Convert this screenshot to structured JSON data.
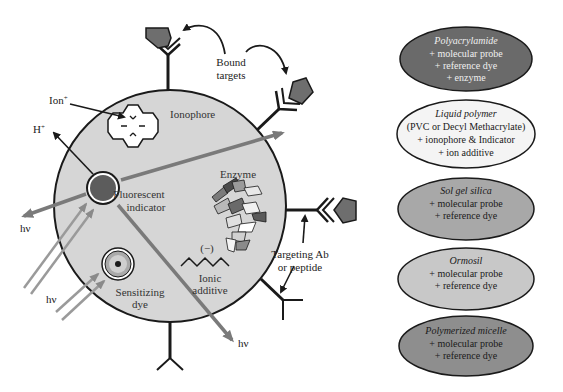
{
  "colors": {
    "background": "#ffffff",
    "particle_fill": "#d6d6d6",
    "outline": "#1a1a1a",
    "light_ray": "#7a7a7a",
    "target_fill": "#6e6e6e",
    "indicator_fill": "#5c5c5c",
    "dark_ellipse": "#6a6a6a",
    "mid_ellipse": "#a8a8a8",
    "light_ellipse": "#c8c8c8",
    "white_ellipse": "#f2f2f2"
  },
  "particle": {
    "labels": {
      "ionophore": "Ionophore",
      "fluorescent_indicator_line1": "Fluorescent",
      "fluorescent_indicator_line2": "indicator",
      "enzyme": "Enzyme",
      "ionic_charge": "(−)",
      "ionic_additive_line1": "Ionic",
      "ionic_additive_line2": "additive",
      "sensitizing_dye_line1": "Sensitizing",
      "sensitizing_dye_line2": "dye"
    }
  },
  "external_labels": {
    "ion": "Ion",
    "ion_sup": "+",
    "proton": "H",
    "proton_sup": "+",
    "hv_left": "hν",
    "hv_lower_left": "hν",
    "hv_bottom": "hν",
    "bound_targets_line1": "Bound",
    "bound_targets_line2": "targets",
    "targeting_line1": "Targeting Ab",
    "targeting_line2": "or peptide"
  },
  "matrix_types": [
    {
      "title": "Polyacrylamide",
      "lines": [
        "+ molecular probe",
        "+ reference dye",
        "+ enzyme"
      ],
      "shade": "dark"
    },
    {
      "title": "Liquid polymer",
      "lines": [
        "(PVC or Decyl Methacrylate)",
        "+ ionophore & Indicator",
        "+ ion additive"
      ],
      "shade": "white"
    },
    {
      "title": "Sol gel silica",
      "lines": [
        "+ molecular probe",
        "+ reference dye"
      ],
      "shade": "mid"
    },
    {
      "title": "Ormosil",
      "lines": [
        "+ molecular probe",
        "+ reference dye"
      ],
      "shade": "light"
    },
    {
      "title": "Polymerized micelle",
      "lines": [
        "+ molecular probe",
        "+ reference dye"
      ],
      "shade": "dark-mid"
    }
  ]
}
